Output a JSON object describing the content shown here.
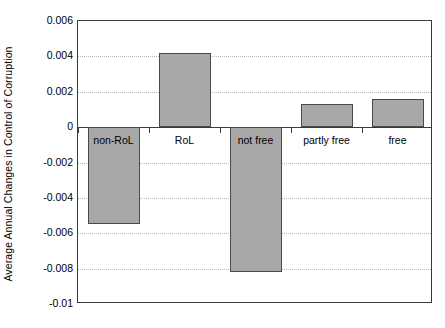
{
  "chart_data": {
    "type": "bar",
    "title": "",
    "xlabel": "",
    "ylabel": "Average Annual Changes in Control of Corruption",
    "categories": [
      "non-RoL",
      "RoL",
      "not free",
      "partly free",
      "free"
    ],
    "values": [
      -0.0055,
      0.0042,
      -0.0082,
      0.0013,
      0.0016
    ],
    "ylim": [
      -0.01,
      0.006
    ],
    "yticks": [
      0.006,
      0.004,
      0.002,
      0,
      -0.002,
      -0.004,
      -0.006,
      -0.008,
      -0.01
    ],
    "ytick_labels": [
      "0.006",
      "0.004",
      "0.002",
      "0",
      "-0.002",
      "-0.004",
      "-0.006",
      "-0.008",
      "-0.01"
    ],
    "grid": true,
    "grid_style": "dotted-horizontal",
    "legend": null,
    "bar_fill_color": "#a8a8a8",
    "bar_edge_color": "#4a4a4a",
    "axis_color": "#3a3a3a",
    "background_color": "#ffffff"
  }
}
